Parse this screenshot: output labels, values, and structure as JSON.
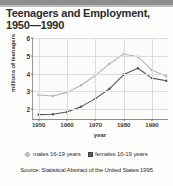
{
  "title": {
    "line1": "Teenagers and Employment,",
    "line2": "1950—1990"
  },
  "source": "Source: Statistical Abstract of the United States 1995",
  "legend": [
    {
      "label": "males 16-19 years",
      "marker": "circle-open",
      "color": "#c6c6c4"
    },
    {
      "label": "females 16-19 years",
      "marker": "square-filled",
      "color": "#5c5c5a"
    }
  ],
  "chart_data": {
    "type": "line",
    "title": "Teenagers and Employment, 1950—1990",
    "xlabel": "year",
    "ylabel": "millions of teenagers",
    "xlim": [
      1948,
      1996
    ],
    "ylim": [
      1.4,
      6.0
    ],
    "yticks": [
      2,
      3,
      4,
      5,
      6
    ],
    "xticks": [
      1950,
      1960,
      1970,
      1980,
      1990
    ],
    "grid": true,
    "legend_position": "below",
    "x": [
      1950,
      1955,
      1960,
      1965,
      1970,
      1975,
      1980,
      1985,
      1990,
      1995
    ],
    "series": [
      {
        "name": "males 16-19 years",
        "color": "#b4b4b2",
        "values": [
          2.8,
          2.75,
          2.95,
          3.35,
          3.9,
          4.55,
          5.1,
          4.95,
          4.2,
          3.85
        ]
      },
      {
        "name": "females 16-19 years",
        "color": "#555553",
        "values": [
          1.7,
          1.72,
          1.85,
          2.15,
          2.6,
          3.15,
          3.95,
          4.3,
          3.75,
          3.6
        ]
      }
    ]
  }
}
